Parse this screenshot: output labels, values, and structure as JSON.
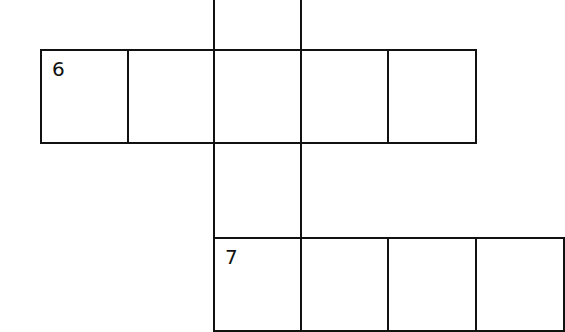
{
  "puzzle": {
    "type": "crossword-fragment",
    "clues": [
      {
        "number": "6",
        "direction": "across",
        "length": 5
      },
      {
        "number": "7",
        "direction": "across",
        "length": 4
      }
    ],
    "cells": [
      {
        "id": "c-top-0",
        "x": 213,
        "y": -45,
        "w": 89,
        "h": 96,
        "label": ""
      },
      {
        "id": "c6-0",
        "x": 40,
        "y": 49,
        "w": 89,
        "h": 95,
        "label": "6"
      },
      {
        "id": "c6-1",
        "x": 127,
        "y": 49,
        "w": 88,
        "h": 95,
        "label": ""
      },
      {
        "id": "c6-2",
        "x": 213,
        "y": 49,
        "w": 89,
        "h": 95,
        "label": ""
      },
      {
        "id": "c6-3",
        "x": 300,
        "y": 49,
        "w": 89,
        "h": 95,
        "label": ""
      },
      {
        "id": "c6-4",
        "x": 387,
        "y": 49,
        "w": 90,
        "h": 95,
        "label": ""
      },
      {
        "id": "c-mid",
        "x": 213,
        "y": 142,
        "w": 89,
        "h": 97,
        "label": ""
      },
      {
        "id": "c7-0",
        "x": 213,
        "y": 237,
        "w": 89,
        "h": 95,
        "label": "7"
      },
      {
        "id": "c7-1",
        "x": 300,
        "y": 237,
        "w": 89,
        "h": 95,
        "label": ""
      },
      {
        "id": "c7-2",
        "x": 387,
        "y": 237,
        "w": 90,
        "h": 95,
        "label": ""
      },
      {
        "id": "c7-3",
        "x": 475,
        "y": 237,
        "w": 90,
        "h": 95,
        "label": ""
      }
    ]
  }
}
